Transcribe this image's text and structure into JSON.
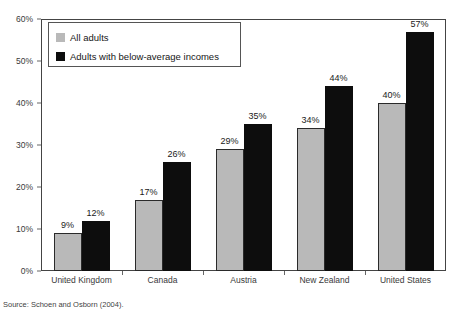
{
  "chart_data": {
    "type": "bar",
    "title": "",
    "subtitle": "",
    "xlabel": "",
    "ylabel": "",
    "ylim": [
      0,
      60
    ],
    "ytick_labels": [
      "0%",
      "10%",
      "20%",
      "30%",
      "40%",
      "50%",
      "60%"
    ],
    "ytick_values": [
      0,
      10,
      20,
      30,
      40,
      50,
      60
    ],
    "grid": false,
    "legend_position": "top-left",
    "categories": [
      "United Kingdom",
      "Canada",
      "Austria",
      "New Zealand",
      "United States"
    ],
    "series": [
      {
        "name": "All adults",
        "color": "#b9b9b9",
        "values": [
          9,
          17,
          29,
          34,
          40
        ],
        "labels": [
          "9%",
          "17%",
          "29%",
          "34%",
          "40%"
        ]
      },
      {
        "name": "Adults with below-average incomes",
        "color": "#0d0d0d",
        "values": [
          12,
          26,
          35,
          44,
          57
        ],
        "labels": [
          "12%",
          "26%",
          "35%",
          "44%",
          "57%"
        ]
      }
    ],
    "source": "Source: Schoen and Osborn (2004)."
  },
  "legend": {
    "entries": [
      {
        "label": "All adults"
      },
      {
        "label": "Adults with below-average incomes"
      }
    ]
  },
  "footer": {
    "source": "Source: Schoen and Osborn (2004)."
  }
}
